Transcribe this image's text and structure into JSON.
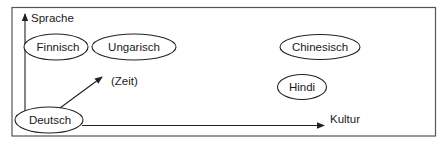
{
  "diagram": {
    "type": "conceptual-axes-diagram",
    "axes": {
      "vertical_label": "Sprache",
      "horizontal_label": "Kultur",
      "diagonal_label": "(Zeit)"
    },
    "nodes": [
      {
        "id": "finnisch",
        "label": "Finnisch"
      },
      {
        "id": "ungarisch",
        "label": "Ungarisch"
      },
      {
        "id": "chinesisch",
        "label": "Chinesisch"
      },
      {
        "id": "hindi",
        "label": "Hindi"
      },
      {
        "id": "deutsch",
        "label": "Deutsch"
      }
    ],
    "colors": {
      "stroke": "#222222",
      "frame": "#555555",
      "background": "#ffffff",
      "text": "#1a1a1a"
    }
  }
}
